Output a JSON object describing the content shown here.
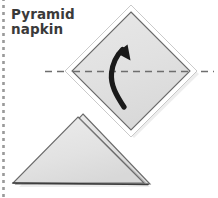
{
  "figure": {
    "kind": "napkin-folding-instruction-diagram",
    "title_lines": [
      "Pyramid",
      "napkin"
    ],
    "title_text": "Pyramid napkin",
    "colors": {
      "background": "#ffffff",
      "napkin_fill": "#e2e2e2",
      "napkin_fill_light": "#ebebeb",
      "napkin_outline": "#555555",
      "napkin_highlight": "#ffffff",
      "fold_line": "#6e6e6e",
      "arrow": "#1a1a1a",
      "title_text": "#3a3a3a",
      "margin_rule": "#9a9a9a"
    },
    "elements": [
      {
        "name": "margin-dashed-rule",
        "role": "page-margin-decoration",
        "orientation": "vertical",
        "x": 3,
        "y_from": 0,
        "y_to": 198,
        "dash": "3 4"
      },
      {
        "name": "napkin-diamond",
        "role": "unfolded-napkin-square-rotated-45",
        "center": [
          131,
          71
        ],
        "half_diagonal": 64,
        "points": "131,7 195,71 131,135 67,71"
      },
      {
        "name": "horizontal-fold-line",
        "role": "fold-guide",
        "orientation": "horizontal",
        "y": 71,
        "x_from": 45,
        "x_to": 218,
        "dash": "7 5"
      },
      {
        "name": "fold-arrow",
        "role": "fold-direction-curved-arrow",
        "direction": "up",
        "start": [
          124,
          106
        ],
        "end": [
          125,
          49
        ]
      },
      {
        "name": "folded-triangle",
        "role": "result-folded-napkin-triangle",
        "points": "78,117 144,183 13,183",
        "layer_offset": [
          6,
          -3
        ]
      }
    ],
    "step_count": 1
  }
}
